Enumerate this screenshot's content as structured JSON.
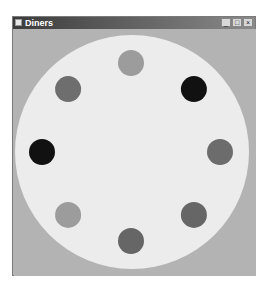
{
  "window": {
    "title": "Diners",
    "icon": "app-icon",
    "controls": [
      {
        "name": "minimize-button",
        "glyph": "_",
        "icon": "minimize-icon"
      },
      {
        "name": "maximize-button",
        "glyph": "□",
        "icon": "maximize-icon"
      },
      {
        "name": "close-button",
        "glyph": "×",
        "icon": "close-icon"
      }
    ]
  },
  "colors": {
    "client_background": "#b3b3b3",
    "table": "#ececec"
  },
  "table": {
    "diners": [
      {
        "position": "top",
        "color": "#9c9c9c"
      },
      {
        "position": "top-right",
        "color": "#111111"
      },
      {
        "position": "right",
        "color": "#6c6c6c"
      },
      {
        "position": "bottom-right",
        "color": "#666666"
      },
      {
        "position": "bottom",
        "color": "#666666"
      },
      {
        "position": "bottom-left",
        "color": "#9c9c9c"
      },
      {
        "position": "left",
        "color": "#111111"
      },
      {
        "position": "top-left",
        "color": "#6e6e6e"
      }
    ]
  }
}
